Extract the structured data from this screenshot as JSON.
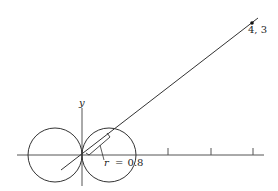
{
  "diagram": {
    "type": "polar-graph-two-circles",
    "axes": {
      "y_label": "y",
      "x_ticks_count": 3
    },
    "point": {
      "label": "4, 3",
      "x": 4,
      "y": 3
    },
    "radius_annotation": {
      "symbol": "r",
      "equals": "=",
      "value": "0.8",
      "text": "r = 0.8"
    },
    "colors": {
      "stroke": "#333333",
      "background": "#ffffff"
    }
  }
}
